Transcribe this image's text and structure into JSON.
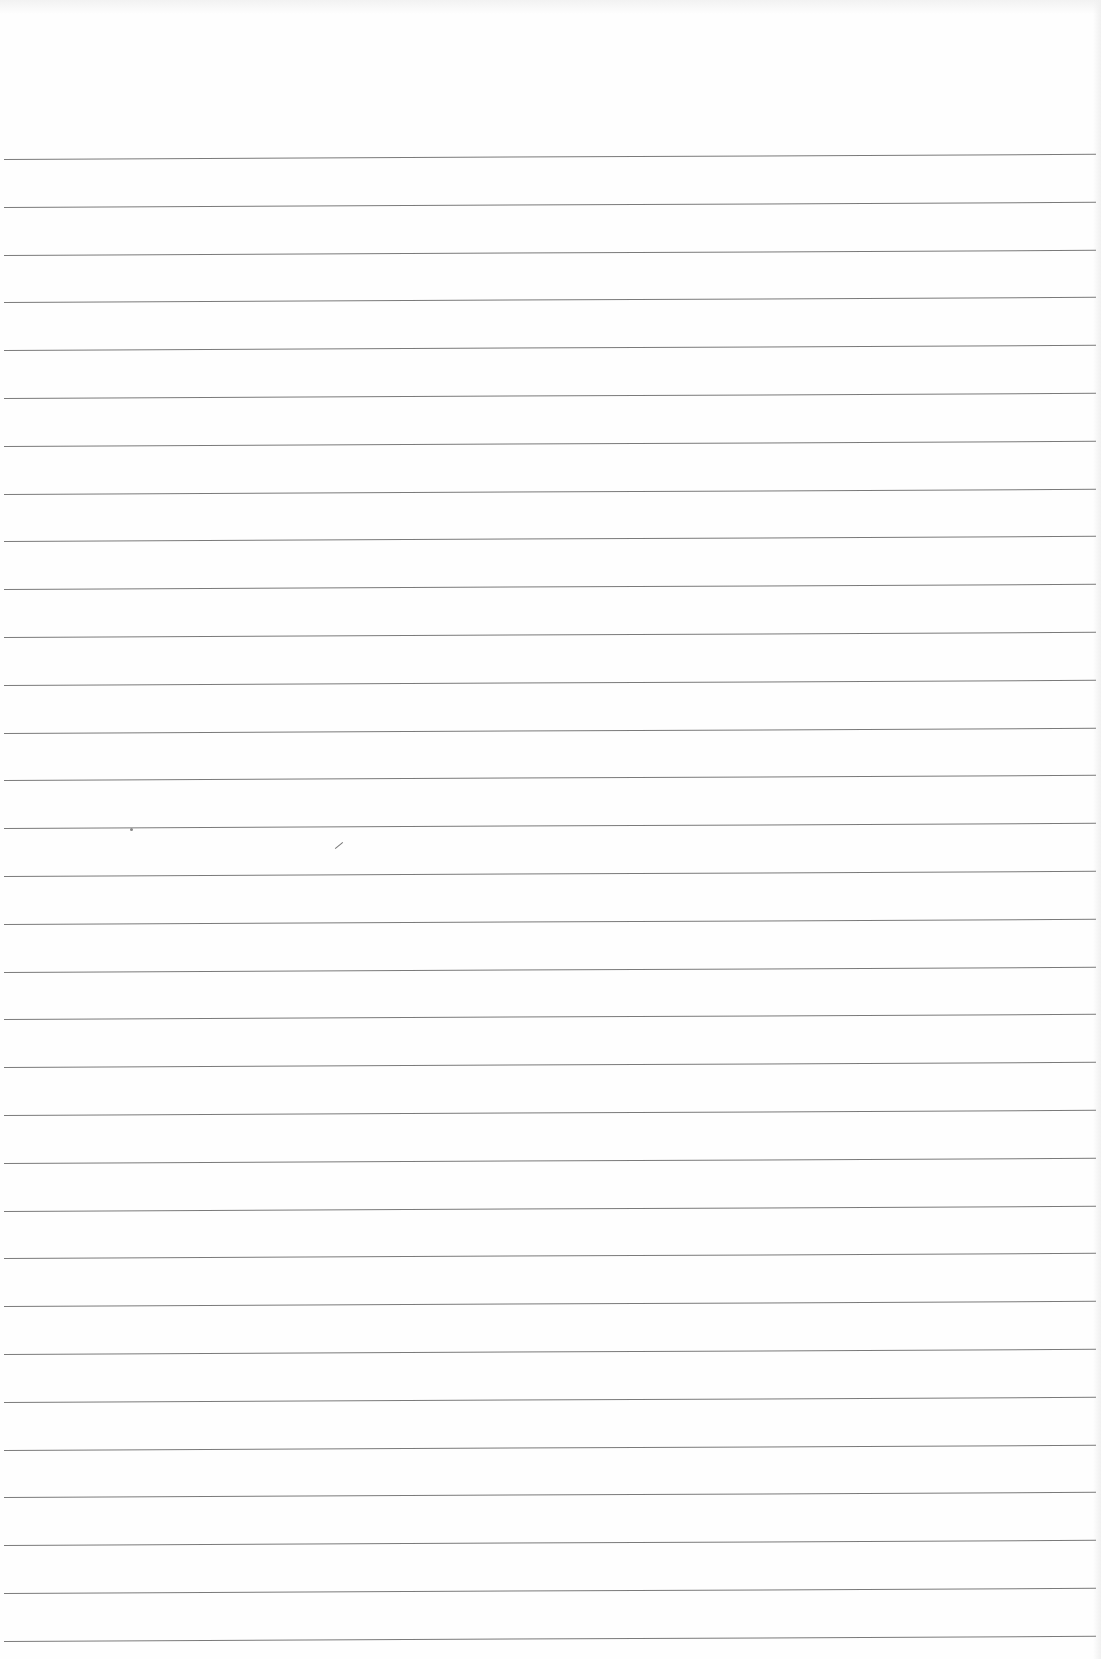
{
  "page": {
    "type": "blank lined paper",
    "rule_count": 32,
    "first_rule_y": 159,
    "rule_spacing": 47.8,
    "rule_color": "#7a7a7a",
    "background_color": "#fefefe"
  },
  "marks": [
    {
      "kind": "speck",
      "x": 130,
      "y": 828
    },
    {
      "kind": "tick",
      "x": 334,
      "y": 845
    }
  ]
}
